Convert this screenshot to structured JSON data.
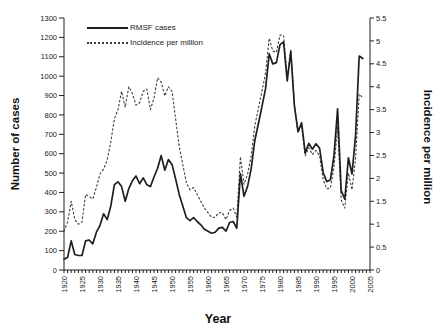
{
  "figure": {
    "background": "#ffffff",
    "solid_line_color": "#1f1f1f",
    "dotted_line_color": "#3a3a3a",
    "text_color": "#1a1a1a"
  },
  "chart_data": {
    "type": "line",
    "title": "",
    "xlabel": "Year",
    "ylabel_left": "Number of cases",
    "ylabel_right": "Incidence per million",
    "grid": "off",
    "legend_position": "top-left-inside",
    "x_range": [
      1920,
      2005
    ],
    "ylim_left": [
      0,
      1300
    ],
    "ylim_right": [
      0,
      5.5
    ],
    "x_start": 1920,
    "x_tick_labels": [
      1920,
      1925,
      1930,
      1935,
      1940,
      1945,
      1950,
      1955,
      1960,
      1965,
      1970,
      1975,
      1980,
      1985,
      1990,
      1995,
      2000,
      2005
    ],
    "left_tick_labels": [
      0,
      100,
      200,
      300,
      400,
      500,
      600,
      700,
      800,
      900,
      1000,
      1100,
      1200,
      1300
    ],
    "right_tick_labels": [
      "0",
      "0.5",
      "1",
      "1.5",
      "2",
      "2.5",
      "3",
      "3.5",
      "4",
      "4.5",
      "5",
      "5.5"
    ],
    "series": [
      {
        "name": "RMSF cases",
        "axis": "left",
        "style": "solid",
        "values": [
          55,
          65,
          150,
          80,
          75,
          75,
          150,
          155,
          135,
          195,
          230,
          290,
          260,
          330,
          440,
          455,
          430,
          355,
          420,
          460,
          485,
          445,
          475,
          440,
          430,
          480,
          525,
          590,
          515,
          570,
          545,
          470,
          390,
          330,
          270,
          255,
          270,
          250,
          233,
          210,
          200,
          190,
          195,
          216,
          220,
          200,
          245,
          250,
          215,
          498,
          380,
          432,
          523,
          668,
          754,
          844,
          937,
          1115,
          1063,
          1070,
          1163,
          1176,
          976,
          1126,
          848,
          714,
          760,
          604,
          653,
          623,
          651,
          628,
          502,
          456,
          465,
          590,
          831,
          409,
          365,
          579,
          495,
          695,
          1104,
          1091
        ]
      },
      {
        "name": "Incidence per million",
        "axis": "right",
        "style": "dotted",
        "values": [
          0.85,
          1.05,
          1.5,
          1.1,
          1.0,
          1.05,
          1.65,
          1.6,
          1.55,
          1.8,
          2.1,
          2.2,
          2.4,
          2.8,
          3.3,
          3.5,
          3.9,
          3.55,
          4.0,
          3.85,
          3.6,
          3.65,
          3.9,
          3.95,
          3.5,
          3.75,
          4.2,
          4.1,
          3.8,
          4.0,
          3.9,
          3.3,
          2.7,
          2.3,
          1.9,
          1.75,
          1.8,
          1.65,
          1.5,
          1.35,
          1.25,
          1.15,
          1.15,
          1.25,
          1.25,
          1.1,
          1.3,
          1.35,
          1.15,
          2.47,
          1.87,
          2.09,
          2.49,
          3.15,
          3.53,
          3.91,
          4.3,
          5.06,
          4.78,
          4.75,
          5.13,
          5.12,
          4.21,
          4.82,
          3.6,
          3.0,
          3.17,
          2.49,
          2.67,
          2.52,
          2.61,
          2.49,
          1.97,
          1.77,
          1.79,
          2.25,
          3.13,
          1.53,
          1.35,
          2.12,
          1.75,
          2.44,
          3.84,
          3.76
        ]
      }
    ]
  }
}
